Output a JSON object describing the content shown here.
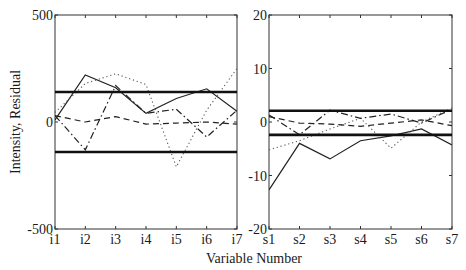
{
  "figure": {
    "xlabel": "Variable Number",
    "ylabel": "Intensity, Residual"
  },
  "chart_data": [
    {
      "type": "line",
      "panel": "left",
      "title": "",
      "xlabel": "",
      "ylabel": "Intensity, Residual",
      "categories": [
        "i1",
        "i2",
        "i3",
        "i4",
        "i5",
        "i6",
        "i7"
      ],
      "ylim": [
        -500,
        500
      ],
      "yticks": [
        -500,
        0,
        500
      ],
      "ytick_labels": [
        "-500",
        "0",
        "500"
      ],
      "grid": false,
      "legend": null,
      "control_limits": {
        "upper": 140,
        "lower": -140
      },
      "series": [
        {
          "name": "solid",
          "style": "solid",
          "values": [
            10,
            220,
            160,
            40,
            110,
            155,
            50
          ]
        },
        {
          "name": "dotted",
          "style": "dotted",
          "values": [
            45,
            180,
            225,
            175,
            -210,
            55,
            250
          ]
        },
        {
          "name": "dash-dot",
          "style": "dashdot",
          "values": [
            30,
            -130,
            170,
            40,
            60,
            -70,
            55
          ]
        },
        {
          "name": "dashed",
          "style": "dashed",
          "values": [
            30,
            0,
            25,
            -10,
            -5,
            0,
            -10
          ]
        }
      ]
    },
    {
      "type": "line",
      "panel": "right",
      "title": "",
      "xlabel": "",
      "ylabel": "",
      "categories": [
        "s1",
        "s2",
        "s3",
        "s4",
        "s5",
        "s6",
        "s7"
      ],
      "ylim": [
        -20,
        20
      ],
      "yticks": [
        -20,
        -10,
        0,
        10,
        20
      ],
      "ytick_labels": [
        "-20",
        "-10",
        "0",
        "10",
        "20"
      ],
      "grid": false,
      "legend": null,
      "control_limits": {
        "upper": 2.1,
        "lower": -2.4
      },
      "series": [
        {
          "name": "solid",
          "style": "solid",
          "values": [
            -12.7,
            -4.0,
            -6.9,
            -3.5,
            -2.6,
            -1.3,
            -4.3
          ]
        },
        {
          "name": "dotted",
          "style": "dotted",
          "values": [
            -5.2,
            -3.5,
            -1.3,
            0.7,
            -4.9,
            0.0,
            2.6
          ]
        },
        {
          "name": "dash-dot",
          "style": "dashdot",
          "values": [
            1.3,
            -2.4,
            2.2,
            0.7,
            1.5,
            -0.2,
            2.4
          ]
        },
        {
          "name": "dashed",
          "style": "dashed",
          "values": [
            1.0,
            -0.2,
            -0.4,
            -0.8,
            -0.2,
            0.4,
            -0.7
          ]
        }
      ]
    }
  ]
}
